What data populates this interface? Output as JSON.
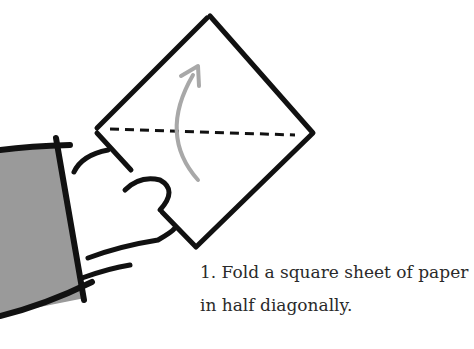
{
  "step": {
    "number": "1.",
    "lines": [
      "1. Fold a square sheet of paper",
      "in half diagonally."
    ]
  },
  "colors": {
    "outline": "#111111",
    "sleeve": "#9a9a9a",
    "arrow": "#a8a8a8",
    "text": "#2a2a2a"
  }
}
